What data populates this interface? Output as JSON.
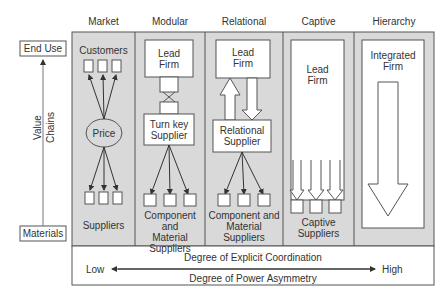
{
  "columns": [
    {
      "title": "Market",
      "top_label": "Customers",
      "middle_label": "Price",
      "bottom_label": "Suppliers"
    },
    {
      "title": "Modular",
      "top_label": "Lead\nFirm",
      "middle_label": "Turn key\nSupplier",
      "bottom_label": "Component and\nMaterial\nSuppliers"
    },
    {
      "title": "Relational",
      "top_label": "Lead\nFirm",
      "middle_label": "Relational\nSupplier",
      "bottom_label": "Component and\nMaterial\nSuppliers"
    },
    {
      "title": "Captive",
      "top_label": "Lead\nFirm",
      "bottom_label": "Captive\nSuppliers"
    },
    {
      "title": "Hierarchy",
      "top_label": "Integrated\nFirm"
    }
  ],
  "axis": {
    "top_label": "End Use",
    "bottom_label": "Materials",
    "vertical_label_1": "Value",
    "vertical_label_2": "Chains"
  },
  "footer": {
    "low": "Low",
    "high": "High",
    "line1": "Degree of Explicit Coordination",
    "line2": "Degree of Power Asymmetry"
  },
  "colors": {
    "panel_fill": "#d9d9d9",
    "line": "#555555",
    "box_fill": "#ffffff"
  }
}
